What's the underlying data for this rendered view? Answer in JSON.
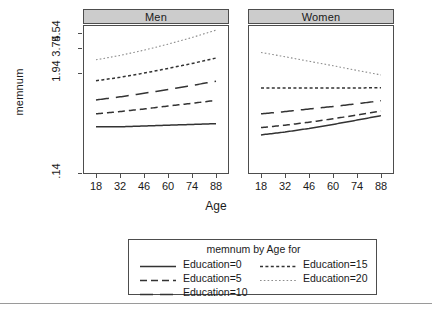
{
  "chart_data": {
    "type": "line",
    "title": "",
    "xlabel": "Age",
    "ylabel": "memnum",
    "y_scale": "log",
    "grid": false,
    "xlim": [
      11,
      95
    ],
    "ylim": [
      0.14,
      6.6
    ],
    "x_ticks": [
      18,
      32,
      46,
      60,
      74,
      88
    ],
    "x_tick_labels": [
      "18",
      "32",
      "46",
      "60",
      "74",
      "88"
    ],
    "y_ticks": [
      0.14,
      1.94,
      3.74,
      5.54
    ],
    "y_tick_labels": [
      ".14",
      "1.94",
      "3.74",
      "5.54"
    ],
    "panels": [
      {
        "label": "Men",
        "series": [
          {
            "name": "Education=0",
            "dash": "solid",
            "color": "#333333",
            "x": [
              18,
              32,
              46,
              60,
              74,
              88
            ],
            "y": [
              0.47,
              0.47,
              0.48,
              0.49,
              0.5,
              0.51
            ]
          },
          {
            "name": "Education=5",
            "dash": "medium-dash",
            "color": "#333333",
            "x": [
              18,
              32,
              46,
              60,
              74,
              88
            ],
            "y": [
              0.66,
              0.7,
              0.75,
              0.81,
              0.87,
              0.94
            ]
          },
          {
            "name": "Education=10",
            "dash": "long-dash",
            "color": "#333333",
            "x": [
              18,
              32,
              46,
              60,
              74,
              88
            ],
            "y": [
              0.95,
              1.03,
              1.13,
              1.25,
              1.39,
              1.55
            ]
          },
          {
            "name": "Education=15",
            "dash": "short-dash",
            "color": "#333333",
            "x": [
              18,
              32,
              46,
              60,
              74,
              88
            ],
            "y": [
              1.57,
              1.72,
              1.92,
              2.17,
              2.47,
              2.85
            ]
          },
          {
            "name": "Education=20",
            "dash": "dotted",
            "color": "#8c8c8c",
            "x": [
              18,
              32,
              46,
              60,
              74,
              88
            ],
            "y": [
              2.72,
              3.05,
              3.5,
              4.1,
              4.88,
              5.92
            ]
          }
        ]
      },
      {
        "label": "Women",
        "series": [
          {
            "name": "Education=0",
            "dash": "solid",
            "color": "#333333",
            "x": [
              18,
              32,
              46,
              60,
              74,
              88
            ],
            "y": [
              0.38,
              0.41,
              0.45,
              0.5,
              0.56,
              0.63
            ]
          },
          {
            "name": "Education=5",
            "dash": "medium-dash",
            "color": "#333333",
            "x": [
              18,
              32,
              46,
              60,
              74,
              88
            ],
            "y": [
              0.46,
              0.49,
              0.53,
              0.58,
              0.64,
              0.71
            ]
          },
          {
            "name": "Education=10",
            "dash": "long-dash",
            "color": "#333333",
            "x": [
              18,
              32,
              46,
              60,
              74,
              88
            ],
            "y": [
              0.66,
              0.7,
              0.75,
              0.8,
              0.86,
              0.93
            ]
          },
          {
            "name": "Education=15",
            "dash": "short-dash",
            "color": "#333333",
            "x": [
              18,
              32,
              46,
              60,
              74,
              88
            ],
            "y": [
              1.3,
              1.3,
              1.3,
              1.3,
              1.3,
              1.31
            ]
          },
          {
            "name": "Education=20",
            "dash": "dotted",
            "color": "#8c8c8c",
            "x": [
              18,
              32,
              46,
              60,
              74,
              88
            ],
            "y": [
              3.3,
              2.95,
              2.62,
              2.33,
              2.06,
              1.83
            ]
          }
        ]
      }
    ],
    "legend": {
      "title": "memnum by Age for",
      "position": "bottom",
      "columns": 2,
      "entries": [
        {
          "label": "Education=0",
          "dash": "solid",
          "color": "#333333"
        },
        {
          "label": "Education=5",
          "dash": "medium-dash",
          "color": "#333333"
        },
        {
          "label": "Education=10",
          "dash": "long-dash",
          "color": "#333333"
        },
        {
          "label": "Education=15",
          "dash": "short-dash",
          "color": "#333333"
        },
        {
          "label": "Education=20",
          "dash": "dotted",
          "color": "#8c8c8c"
        }
      ]
    }
  }
}
